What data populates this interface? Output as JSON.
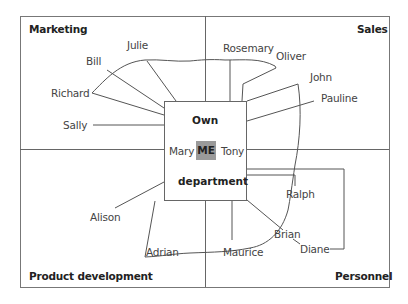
{
  "diagram": {
    "colors": {
      "line": "#555555",
      "border": "#777777",
      "me_fill": "#9a9a9a",
      "text": "#444444",
      "heading_text": "#222222"
    },
    "quadrants": {
      "top_left": "Marketing",
      "top_right": "Sales",
      "bottom_left": "Product development",
      "bottom_right": "Personnel"
    },
    "center": {
      "title_top": "Own",
      "title_bottom": "department",
      "me": "ME",
      "left_colleague": "Mary",
      "right_colleague": "Tony"
    },
    "people": {
      "julie": "Julie",
      "bill": "Bill",
      "richard": "Richard",
      "sally": "Sally",
      "rosemary": "Rosemary",
      "oliver": "Oliver",
      "john": "John",
      "pauline": "Pauline",
      "alison": "Alison",
      "adrian": "Adrian",
      "maurice": "Maurice",
      "ralph": "Ralph",
      "brian": "Brian",
      "diane": "Diane"
    }
  }
}
